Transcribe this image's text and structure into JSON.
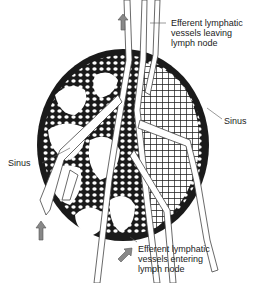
{
  "diagram": {
    "labels": {
      "top_right": [
        "Efferent lymphatic",
        "vessels leaving",
        "lymph node"
      ],
      "bottom_right": [
        "Efferent lymphatic",
        "vessels entering",
        "lymph node"
      ],
      "left_sinus": "Sinus",
      "right_sinus": "Sinus"
    },
    "icons": {
      "top_arrow": "arrow-up-icon",
      "bottom_left_arrow": "arrow-up-icon",
      "bottom_right_arrow": "arrow-up-right-icon"
    },
    "colors": {
      "ink": "#1a1a1a",
      "line": "#555555",
      "arrow": "#888888",
      "background": "#ffffff"
    }
  }
}
